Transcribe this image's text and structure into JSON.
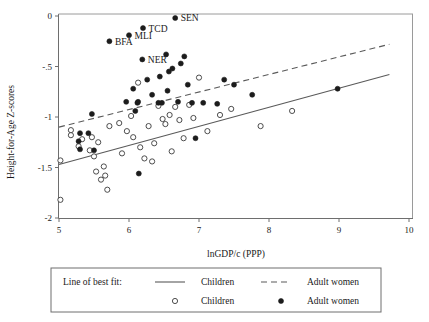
{
  "chart_data": {
    "type": "scatter",
    "title": "",
    "xlabel": "lnGDP/c (PPP)",
    "ylabel": "Height-for-Age Z-scores",
    "xlim": [
      5,
      10
    ],
    "ylim": [
      -2,
      0
    ],
    "xticks": [
      5,
      6,
      7,
      8,
      9,
      10
    ],
    "xticklabels": [
      "5",
      "6",
      "7",
      "8",
      "9",
      "10"
    ],
    "yticks": [
      0,
      -0.5,
      -1,
      -1.5,
      -2
    ],
    "yticklabels": [
      "0",
      "-.5",
      "-1",
      "-1.5",
      "-2"
    ],
    "grid": false,
    "legend_position": "below-axes",
    "series": [
      {
        "name": "Children",
        "marker": "open-circle",
        "points": [
          {
            "x": 5.02,
            "y": -1.82
          },
          {
            "x": 5.02,
            "y": -1.43
          },
          {
            "x": 5.17,
            "y": -1.13
          },
          {
            "x": 5.17,
            "y": -1.18
          },
          {
            "x": 5.28,
            "y": -1.29
          },
          {
            "x": 5.33,
            "y": -1.22
          },
          {
            "x": 5.44,
            "y": -1.33
          },
          {
            "x": 5.47,
            "y": -1.2
          },
          {
            "x": 5.5,
            "y": -1.39
          },
          {
            "x": 5.53,
            "y": -1.54
          },
          {
            "x": 5.56,
            "y": -1.25
          },
          {
            "x": 5.6,
            "y": -1.62
          },
          {
            "x": 5.64,
            "y": -1.49
          },
          {
            "x": 5.66,
            "y": -1.58
          },
          {
            "x": 5.69,
            "y": -1.72
          },
          {
            "x": 5.72,
            "y": -1.09
          },
          {
            "x": 5.86,
            "y": -1.06
          },
          {
            "x": 5.9,
            "y": -1.36
          },
          {
            "x": 5.97,
            "y": -1.14
          },
          {
            "x": 6.03,
            "y": -0.99
          },
          {
            "x": 6.06,
            "y": -1.2
          },
          {
            "x": 6.13,
            "y": -0.66
          },
          {
            "x": 6.16,
            "y": -1.3
          },
          {
            "x": 6.22,
            "y": -1.41
          },
          {
            "x": 6.28,
            "y": -1.09
          },
          {
            "x": 6.33,
            "y": -1.44
          },
          {
            "x": 6.36,
            "y": -1.26
          },
          {
            "x": 6.42,
            "y": -0.89
          },
          {
            "x": 6.48,
            "y": -1.02
          },
          {
            "x": 6.52,
            "y": -1.07
          },
          {
            "x": 6.58,
            "y": -0.98
          },
          {
            "x": 6.61,
            "y": -1.34
          },
          {
            "x": 6.66,
            "y": -0.9
          },
          {
            "x": 6.72,
            "y": -1.03
          },
          {
            "x": 6.78,
            "y": -1.21
          },
          {
            "x": 6.86,
            "y": -0.88
          },
          {
            "x": 6.92,
            "y": -1.01
          },
          {
            "x": 7.0,
            "y": -0.61
          },
          {
            "x": 7.12,
            "y": -1.14
          },
          {
            "x": 7.3,
            "y": -0.98
          },
          {
            "x": 7.46,
            "y": -0.92
          },
          {
            "x": 7.88,
            "y": -1.09
          },
          {
            "x": 8.33,
            "y": -0.94
          }
        ]
      },
      {
        "name": "Adult women",
        "marker": "filled-circle",
        "points": [
          {
            "x": 5.28,
            "y": -1.24
          },
          {
            "x": 5.3,
            "y": -1.16
          },
          {
            "x": 5.3,
            "y": -1.32
          },
          {
            "x": 5.42,
            "y": -1.16
          },
          {
            "x": 5.47,
            "y": -0.97
          },
          {
            "x": 5.5,
            "y": -1.33
          },
          {
            "x": 5.72,
            "y": -0.25
          },
          {
            "x": 5.96,
            "y": -0.85
          },
          {
            "x": 6.0,
            "y": -0.19
          },
          {
            "x": 6.06,
            "y": -0.72
          },
          {
            "x": 6.09,
            "y": -0.94
          },
          {
            "x": 6.12,
            "y": -0.86
          },
          {
            "x": 6.13,
            "y": -0.85
          },
          {
            "x": 6.14,
            "y": -1.56
          },
          {
            "x": 6.19,
            "y": -0.43
          },
          {
            "x": 6.2,
            "y": -0.12
          },
          {
            "x": 6.26,
            "y": -0.63
          },
          {
            "x": 6.33,
            "y": -0.78
          },
          {
            "x": 6.42,
            "y": -0.86
          },
          {
            "x": 6.44,
            "y": -0.6
          },
          {
            "x": 6.47,
            "y": -0.86
          },
          {
            "x": 6.53,
            "y": -0.38
          },
          {
            "x": 6.55,
            "y": -0.74
          },
          {
            "x": 6.57,
            "y": -0.55
          },
          {
            "x": 6.62,
            "y": -0.52
          },
          {
            "x": 6.66,
            "y": -0.02
          },
          {
            "x": 6.7,
            "y": -0.85
          },
          {
            "x": 6.74,
            "y": -0.47
          },
          {
            "x": 6.79,
            "y": -0.4
          },
          {
            "x": 6.84,
            "y": -0.68
          },
          {
            "x": 6.9,
            "y": -0.86
          },
          {
            "x": 6.95,
            "y": -1.21
          },
          {
            "x": 7.06,
            "y": -0.86
          },
          {
            "x": 7.26,
            "y": -0.87
          },
          {
            "x": 7.36,
            "y": -0.63
          },
          {
            "x": 7.5,
            "y": -0.68
          },
          {
            "x": 7.76,
            "y": -0.78
          },
          {
            "x": 8.98,
            "y": -0.72
          }
        ]
      }
    ],
    "fit_lines": [
      {
        "name": "Children",
        "style": "solid",
        "x_start": 5.0,
        "y_start": -1.47,
        "x_end": 9.72,
        "y_end": -0.58
      },
      {
        "name": "Adult women",
        "style": "dashed",
        "x_start": 5.0,
        "y_start": -1.1,
        "x_end": 9.72,
        "y_end": -0.28
      }
    ],
    "annotations": [
      {
        "label": "SEN",
        "x": 6.66,
        "y": -0.02
      },
      {
        "label": "TCD",
        "x": 6.2,
        "y": -0.12
      },
      {
        "label": "MLI",
        "x": 6.0,
        "y": -0.19
      },
      {
        "label": "BFA",
        "x": 5.72,
        "y": -0.25
      },
      {
        "label": "NER",
        "x": 6.19,
        "y": -0.43
      }
    ]
  },
  "legend": {
    "title": "Line of best fit:",
    "rows": [
      {
        "symbol": "solid-line",
        "label": "Children",
        "symbol2": "dashed-line",
        "label2": "Adult women"
      },
      {
        "symbol": "open-circle",
        "label": "Children",
        "symbol2": "filled-circle",
        "label2": "Adult women"
      }
    ]
  },
  "colors": {
    "marker_fill": "#1c1c1c",
    "marker_stroke": "#3a3a3a",
    "line": "#5a5a5a",
    "axis": "#6e6e6e",
    "background": "#ffffff"
  }
}
